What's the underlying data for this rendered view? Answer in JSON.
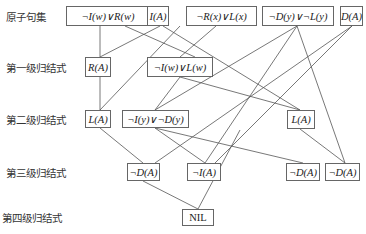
{
  "levels": [
    {
      "label": "原子句集",
      "x": 6,
      "y": 16
    },
    {
      "label": "第一级归结式",
      "x": 6,
      "y": 67
    },
    {
      "label": "第二级归结式",
      "x": 6,
      "y": 119
    },
    {
      "label": "第三级归结式",
      "x": 6,
      "y": 172
    },
    {
      "label": "第四级归结式",
      "x": 2,
      "y": 217
    }
  ],
  "nodes": {
    "c1": {
      "label": "¬I(w)∨R(w)",
      "x": 66,
      "y": 6,
      "w": 84,
      "h": 20
    },
    "c2": {
      "label": "I(A)",
      "x": 147,
      "y": 6,
      "w": 22,
      "h": 20
    },
    "c3": {
      "label": "¬R(x)∨L(x)",
      "x": 186,
      "y": 6,
      "w": 71,
      "h": 20
    },
    "c4": {
      "label": "¬D(y)∨¬L(y)",
      "x": 262,
      "y": 6,
      "w": 72,
      "h": 20
    },
    "c5": {
      "label": "D(A)",
      "x": 340,
      "y": 6,
      "w": 23,
      "h": 20
    },
    "r1a": {
      "label": "R(A)",
      "x": 85,
      "y": 57,
      "w": 26,
      "h": 20
    },
    "r1b": {
      "label": "¬I(w)∨L(w)",
      "x": 147,
      "y": 57,
      "w": 66,
      "h": 20
    },
    "r2a": {
      "label": "L(A)",
      "x": 85,
      "y": 110,
      "w": 26,
      "h": 18
    },
    "r2b": {
      "label": "¬I(y)∨¬D(y)",
      "x": 122,
      "y": 110,
      "w": 67,
      "h": 18
    },
    "r2c": {
      "label": "L(A)",
      "x": 287,
      "y": 110,
      "w": 28,
      "h": 19
    },
    "r3a": {
      "label": "¬D(A)",
      "x": 127,
      "y": 163,
      "w": 33,
      "h": 18
    },
    "r3b": {
      "label": "¬I(A)",
      "x": 187,
      "y": 163,
      "w": 34,
      "h": 18
    },
    "r3c": {
      "label": "¬D(A)",
      "x": 286,
      "y": 163,
      "w": 34,
      "h": 18
    },
    "r3d": {
      "label": "¬D(A)",
      "x": 325,
      "y": 163,
      "w": 35,
      "h": 18
    },
    "nil": {
      "label": "NIL",
      "x": 182,
      "y": 209,
      "w": 32,
      "h": 17
    }
  },
  "edges": [
    {
      "from": "c1",
      "to": "r1a",
      "x1": 100,
      "y1": 26,
      "x2": 100,
      "y2": 57
    },
    {
      "from": "c2",
      "to": "r1a",
      "x1": 160,
      "y1": 26,
      "x2": 100,
      "y2": 57
    },
    {
      "from": "c1",
      "to": "r1b",
      "x1": 125,
      "y1": 26,
      "x2": 195,
      "y2": 57
    },
    {
      "from": "c3",
      "to": "r1b",
      "x1": 216,
      "y1": 26,
      "x2": 180,
      "y2": 57
    },
    {
      "from": "c2",
      "to": "r2c",
      "x1": 163,
      "y1": 26,
      "x2": 300,
      "y2": 110
    },
    {
      "from": "c3",
      "to": "r2a",
      "x1": 180,
      "y1": 26,
      "x2": 100,
      "y2": 110
    },
    {
      "from": "r1a",
      "to": "r2a",
      "x1": 100,
      "y1": 77,
      "x2": 100,
      "y2": 110
    },
    {
      "from": "c4",
      "to": "r2b",
      "x1": 297,
      "y1": 26,
      "x2": 155,
      "y2": 110
    },
    {
      "from": "r1b",
      "to": "r2b",
      "x1": 180,
      "y1": 77,
      "x2": 155,
      "y2": 110
    },
    {
      "from": "c4",
      "to": "r3c",
      "x1": 297,
      "y1": 26,
      "x2": 205,
      "y2": 163
    },
    {
      "from": "c4",
      "to": "r3d",
      "x1": 297,
      "y1": 26,
      "x2": 345,
      "y2": 163
    },
    {
      "from": "r1b",
      "to": "r2c",
      "x1": 180,
      "y1": 77,
      "x2": 300,
      "y2": 110
    },
    {
      "from": "c5",
      "to": "r3a",
      "x1": 352,
      "y1": 26,
      "x2": 155,
      "y2": 163
    },
    {
      "from": "c5",
      "to": "r3b",
      "x1": 352,
      "y1": 26,
      "x2": 215,
      "y2": 163
    },
    {
      "from": "r2a",
      "to": "r3a",
      "x1": 100,
      "y1": 128,
      "x2": 143,
      "y2": 163
    },
    {
      "from": "r2b",
      "to": "r3b",
      "x1": 155,
      "y1": 128,
      "x2": 205,
      "y2": 163
    },
    {
      "from": "r2b",
      "to": "r3c",
      "x1": 155,
      "y1": 128,
      "x2": 303,
      "y2": 163
    },
    {
      "from": "r2c",
      "to": "r3c",
      "x1": 300,
      "y1": 129,
      "x2": 345,
      "y2": 163
    },
    {
      "from": "r3a",
      "to": "nil",
      "x1": 143,
      "y1": 181,
      "x2": 198,
      "y2": 209
    },
    {
      "from": "c2",
      "to": "nil",
      "x1": 240,
      "y1": 130,
      "x2": 198,
      "y2": 209
    }
  ]
}
